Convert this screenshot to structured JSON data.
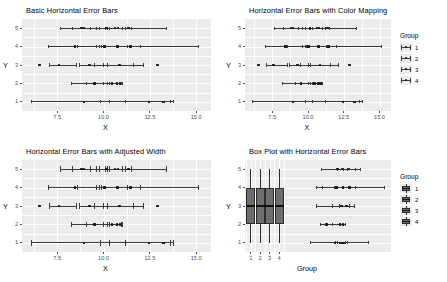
{
  "figure": {
    "width": 447,
    "height": 282,
    "background": "#ffffff",
    "panel_background": "#ebebeb",
    "grid_color": "#ffffff",
    "ink_color": "#3a3a3a",
    "point_color": "#1a1a1a",
    "box_fill": "#6e6e6e"
  },
  "chart_data": [
    {
      "id": "panel-basic",
      "type": "scatter",
      "title": "Basic Horizontal Error Bars",
      "xlabel": "X",
      "ylabel": "Y",
      "xlim": [
        5.6,
        15.8
      ],
      "ylim": [
        0.5,
        5.5
      ],
      "xticks": [
        7.5,
        10.0,
        12.5,
        15.0
      ],
      "xticklabels": [
        "7.5",
        "10.0",
        "12.5",
        "15.0"
      ],
      "yticks": [
        1,
        2,
        3,
        4,
        5
      ],
      "yticklabels": [
        "1",
        "2",
        "3",
        "4",
        "5"
      ],
      "grid": true,
      "legend": null,
      "series": [
        {
          "y": 5,
          "points": [
            8.82,
            8.95,
            10.15,
            10.62,
            10.78,
            11.35
          ],
          "errorbars": [
            {
              "x": 8.82,
              "xmin": 7.65,
              "xmax": 9.6
            },
            {
              "x": 8.95,
              "xmin": 8.3,
              "xmax": 9.8
            },
            {
              "x": 10.15,
              "xmin": 9.3,
              "xmax": 11.0
            },
            {
              "x": 10.62,
              "xmin": 10.1,
              "xmax": 11.2
            },
            {
              "x": 10.78,
              "xmin": 10.3,
              "xmax": 11.5
            },
            {
              "x": 11.35,
              "xmin": 10.2,
              "xmax": 13.4
            }
          ]
        },
        {
          "y": 4,
          "points": [
            8.45,
            10.05,
            10.75,
            11.45
          ],
          "errorbars": [
            {
              "x": 8.45,
              "xmin": 7.05,
              "xmax": 9.9
            },
            {
              "x": 10.05,
              "xmin": 8.6,
              "xmax": 11.3
            },
            {
              "x": 10.75,
              "xmin": 9.8,
              "xmax": 12.0
            },
            {
              "x": 11.45,
              "xmin": 9.6,
              "xmax": 15.1
            }
          ]
        },
        {
          "y": 3,
          "points": [
            6.55,
            7.6,
            9.25,
            10.85,
            12.9
          ],
          "errorbars": [
            {
              "x": 7.6,
              "xmin": 7.1,
              "xmax": 8.55
            },
            {
              "x": 9.25,
              "xmin": 8.7,
              "xmax": 10.0
            },
            {
              "x": 10.85,
              "xmin": 9.5,
              "xmax": 12.15
            },
            {
              "x": 10.85,
              "xmin": 10.2,
              "xmax": 11.6
            }
          ]
        },
        {
          "y": 2,
          "points": [
            9.5,
            10.45,
            10.72,
            10.9
          ],
          "errorbars": [
            {
              "x": 9.5,
              "xmin": 8.25,
              "xmax": 10.2
            },
            {
              "x": 10.45,
              "xmin": 9.1,
              "xmax": 10.95
            },
            {
              "x": 10.72,
              "xmin": 10.0,
              "xmax": 11.0
            },
            {
              "x": 10.9,
              "xmin": 10.3,
              "xmax": 11.0
            }
          ]
        },
        {
          "y": 1,
          "points": [
            8.95,
            12.45,
            13.25
          ],
          "errorbars": [
            {
              "x": 8.95,
              "xmin": 6.1,
              "xmax": 10.3
            },
            {
              "x": 12.45,
              "xmin": 9.85,
              "xmax": 13.6
            },
            {
              "x": 13.25,
              "xmin": 11.2,
              "xmax": 13.8
            }
          ]
        }
      ]
    },
    {
      "id": "panel-color",
      "type": "scatter",
      "title": "Horizontal Error Bars with Color Mapping",
      "xlabel": "X",
      "ylabel": "Y",
      "xlim": [
        5.6,
        15.8
      ],
      "ylim": [
        0.5,
        5.5
      ],
      "xticks": [
        7.5,
        10.0,
        12.5,
        15.0
      ],
      "xticklabels": [
        "7.5",
        "10.0",
        "12.5",
        "15.0"
      ],
      "yticks": [
        1,
        2,
        3,
        4,
        5
      ],
      "yticklabels": [
        "1",
        "2",
        "3",
        "4",
        "5"
      ],
      "grid": true,
      "legend": {
        "title": "Group",
        "position": "right",
        "entries": [
          "1",
          "2",
          "3",
          "4"
        ]
      },
      "series": [
        {
          "y": 5,
          "points": [
            8.82,
            8.95,
            10.15,
            10.62,
            10.78,
            11.35
          ],
          "errorbars": [
            {
              "x": 8.82,
              "xmin": 7.65,
              "xmax": 9.6
            },
            {
              "x": 8.95,
              "xmin": 8.3,
              "xmax": 9.8
            },
            {
              "x": 10.15,
              "xmin": 9.3,
              "xmax": 11.0
            },
            {
              "x": 10.62,
              "xmin": 10.1,
              "xmax": 11.2
            },
            {
              "x": 10.78,
              "xmin": 10.3,
              "xmax": 11.5
            },
            {
              "x": 11.35,
              "xmin": 10.2,
              "xmax": 13.4
            }
          ]
        },
        {
          "y": 4,
          "points": [
            8.45,
            10.05,
            10.75,
            11.45
          ],
          "errorbars": [
            {
              "x": 8.45,
              "xmin": 7.05,
              "xmax": 9.9
            },
            {
              "x": 10.05,
              "xmin": 8.6,
              "xmax": 11.3
            },
            {
              "x": 10.75,
              "xmin": 9.8,
              "xmax": 12.0
            },
            {
              "x": 11.45,
              "xmin": 9.6,
              "xmax": 15.1
            }
          ]
        },
        {
          "y": 3,
          "points": [
            6.55,
            7.6,
            9.25,
            10.85,
            12.9
          ],
          "errorbars": [
            {
              "x": 7.6,
              "xmin": 7.1,
              "xmax": 8.55
            },
            {
              "x": 9.25,
              "xmin": 8.7,
              "xmax": 10.0
            },
            {
              "x": 10.85,
              "xmin": 9.5,
              "xmax": 12.15
            },
            {
              "x": 10.85,
              "xmin": 10.2,
              "xmax": 11.6
            }
          ]
        },
        {
          "y": 2,
          "points": [
            9.5,
            10.45,
            10.72,
            10.9
          ],
          "errorbars": [
            {
              "x": 9.5,
              "xmin": 8.25,
              "xmax": 10.2
            },
            {
              "x": 10.45,
              "xmin": 9.1,
              "xmax": 10.95
            },
            {
              "x": 10.72,
              "xmin": 10.0,
              "xmax": 11.0
            },
            {
              "x": 10.9,
              "xmin": 10.3,
              "xmax": 11.0
            }
          ]
        },
        {
          "y": 1,
          "points": [
            8.95,
            12.45,
            13.25
          ],
          "errorbars": [
            {
              "x": 8.95,
              "xmin": 6.1,
              "xmax": 10.3
            },
            {
              "x": 12.45,
              "xmin": 9.85,
              "xmax": 13.6
            },
            {
              "x": 13.25,
              "xmin": 11.2,
              "xmax": 13.8
            }
          ]
        }
      ]
    },
    {
      "id": "panel-width",
      "type": "scatter",
      "title": "Horizontal Error Bars with Adjusted Width",
      "xlabel": "X",
      "ylabel": "Y",
      "xlim": [
        5.6,
        15.8
      ],
      "ylim": [
        0.5,
        5.5
      ],
      "xticks": [
        7.5,
        10.0,
        12.5,
        15.0
      ],
      "xticklabels": [
        "7.5",
        "10.0",
        "12.5",
        "15.0"
      ],
      "yticks": [
        1,
        2,
        3,
        4,
        5
      ],
      "yticklabels": [
        "1",
        "2",
        "3",
        "4",
        "5"
      ],
      "grid": true,
      "legend": null,
      "cap_height_scale": 2.4,
      "series": [
        {
          "y": 5,
          "points": [
            8.82,
            8.95,
            10.15,
            10.62,
            10.78,
            11.35
          ],
          "errorbars": [
            {
              "x": 8.82,
              "xmin": 7.65,
              "xmax": 9.6
            },
            {
              "x": 8.95,
              "xmin": 8.3,
              "xmax": 9.8
            },
            {
              "x": 10.15,
              "xmin": 9.3,
              "xmax": 11.0
            },
            {
              "x": 10.62,
              "xmin": 10.1,
              "xmax": 11.2
            },
            {
              "x": 10.78,
              "xmin": 10.3,
              "xmax": 11.5
            },
            {
              "x": 11.35,
              "xmin": 10.2,
              "xmax": 13.4
            }
          ]
        },
        {
          "y": 4,
          "points": [
            8.45,
            10.05,
            10.75,
            11.45
          ],
          "errorbars": [
            {
              "x": 8.45,
              "xmin": 7.05,
              "xmax": 9.9
            },
            {
              "x": 10.05,
              "xmin": 8.6,
              "xmax": 11.3
            },
            {
              "x": 10.75,
              "xmin": 9.8,
              "xmax": 12.0
            },
            {
              "x": 11.45,
              "xmin": 9.6,
              "xmax": 15.1
            }
          ]
        },
        {
          "y": 3,
          "points": [
            6.55,
            7.6,
            9.25,
            10.85,
            12.9
          ],
          "errorbars": [
            {
              "x": 7.6,
              "xmin": 7.1,
              "xmax": 8.55
            },
            {
              "x": 9.25,
              "xmin": 8.7,
              "xmax": 10.0
            },
            {
              "x": 10.85,
              "xmin": 9.5,
              "xmax": 12.15
            },
            {
              "x": 10.85,
              "xmin": 10.2,
              "xmax": 11.6
            }
          ]
        },
        {
          "y": 2,
          "points": [
            9.5,
            10.45,
            10.72,
            10.9
          ],
          "errorbars": [
            {
              "x": 9.5,
              "xmin": 8.25,
              "xmax": 10.2
            },
            {
              "x": 10.45,
              "xmin": 9.1,
              "xmax": 10.95
            },
            {
              "x": 10.72,
              "xmin": 10.0,
              "xmax": 11.0
            },
            {
              "x": 10.9,
              "xmin": 10.3,
              "xmax": 11.0
            }
          ]
        },
        {
          "y": 1,
          "points": [
            8.95,
            12.45,
            13.25
          ],
          "errorbars": [
            {
              "x": 8.95,
              "xmin": 6.1,
              "xmax": 10.3
            },
            {
              "x": 12.45,
              "xmin": 9.85,
              "xmax": 13.6
            },
            {
              "x": 13.25,
              "xmin": 11.2,
              "xmax": 13.8
            }
          ]
        }
      ]
    },
    {
      "id": "panel-box",
      "type": "boxplot",
      "title": "Box Plot with Horizontal Error Bars",
      "xlabel": "Group",
      "ylabel": "Y",
      "xlim": [
        0.4,
        15.8
      ],
      "ylim": [
        0.5,
        5.5
      ],
      "xticks": [
        1,
        2,
        3,
        4
      ],
      "xticklabels": [
        "1",
        "2",
        "3",
        "4"
      ],
      "yticks": [
        1,
        2,
        3,
        4,
        5
      ],
      "yticklabels": [
        "1",
        "2",
        "3",
        "4",
        "5"
      ],
      "grid": true,
      "legend": {
        "title": "Group",
        "position": "right",
        "entries": [
          "1",
          "2",
          "3",
          "4"
        ]
      },
      "boxes": [
        {
          "group": "1",
          "x": 1,
          "q1": 2,
          "median": 3,
          "q3": 4,
          "whisker_low": 1,
          "whisker_high": 5
        },
        {
          "group": "2",
          "x": 2,
          "q1": 2,
          "median": 3,
          "q3": 4,
          "whisker_low": 1,
          "whisker_high": 5
        },
        {
          "group": "3",
          "x": 3,
          "q1": 2,
          "median": 3,
          "q3": 4,
          "whisker_low": 1,
          "whisker_high": 5
        },
        {
          "group": "4",
          "x": 4,
          "q1": 2,
          "median": 3,
          "q3": 4,
          "whisker_low": 1,
          "whisker_high": 5
        }
      ],
      "series": [
        {
          "y": 5,
          "points": [
            10.15,
            10.62,
            11.35
          ],
          "errorbars": [
            {
              "x": 10.15,
              "xmin": 8.5,
              "xmax": 12.6
            },
            {
              "x": 10.62,
              "xmin": 10.1,
              "xmax": 11.2
            },
            {
              "x": 11.35,
              "xmin": 10.8,
              "xmax": 12.0
            }
          ]
        },
        {
          "y": 4,
          "points": [
            10.05,
            10.75,
            11.45
          ],
          "errorbars": [
            {
              "x": 10.05,
              "xmin": 7.9,
              "xmax": 11.3
            },
            {
              "x": 10.75,
              "xmin": 9.8,
              "xmax": 12.0
            },
            {
              "x": 11.45,
              "xmin": 8.6,
              "xmax": 15.1
            }
          ]
        },
        {
          "y": 3,
          "points": [
            10.6,
            11.1
          ],
          "errorbars": [
            {
              "x": 10.6,
              "xmin": 7.9,
              "xmax": 11.9
            },
            {
              "x": 10.6,
              "xmin": 9.6,
              "xmax": 11.4
            },
            {
              "x": 11.1,
              "xmin": 10.4,
              "xmax": 11.9
            }
          ]
        },
        {
          "y": 2,
          "points": [
            9.0,
            10.4,
            10.75
          ],
          "errorbars": [
            {
              "x": 9.0,
              "xmin": 8.4,
              "xmax": 9.6
            },
            {
              "x": 10.4,
              "xmin": 9.6,
              "xmax": 11.0
            },
            {
              "x": 10.75,
              "xmin": 10.4,
              "xmax": 11.0
            }
          ]
        },
        {
          "y": 1,
          "points": [
            9.9,
            10.45,
            10.8
          ],
          "errorbars": [
            {
              "x": 9.9,
              "xmin": 7.3,
              "xmax": 11.2
            },
            {
              "x": 10.45,
              "xmin": 9.9,
              "xmax": 11.0
            },
            {
              "x": 10.8,
              "xmin": 10.2,
              "xmax": 13.4
            }
          ]
        }
      ]
    }
  ]
}
